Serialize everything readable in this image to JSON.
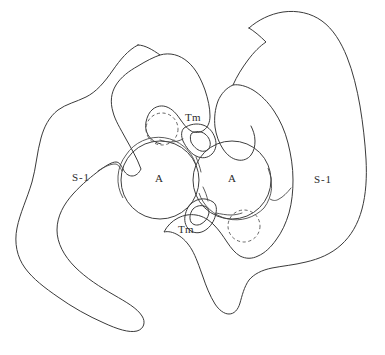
{
  "figure": {
    "background_color": "#ffffff",
    "line_color": "#3a3a3a",
    "width": 385,
    "height": 355
  },
  "labels": {
    "s1_left": "S-1",
    "s1_right": "S-1",
    "actin_left": "A",
    "actin_right": "A",
    "tm_top": "Tm",
    "tm_bottom": "Tm"
  },
  "structures": {
    "actin_left": {
      "name": "actin-filament-left",
      "cx": 160,
      "cy": 180,
      "r": 39
    },
    "actin_right": {
      "name": "actin-filament-right",
      "cx": 232,
      "cy": 180,
      "r": 39
    },
    "dashed_top": {
      "name": "tropomyosin-alternate-position-top",
      "cx": 162,
      "cy": 129,
      "r": 16
    },
    "dashed_bottom": {
      "name": "tropomyosin-alternate-position-bottom",
      "cx": 244,
      "cy": 226,
      "r": 16
    },
    "tm_top": {
      "name": "tropomyosin-top",
      "cx": 204,
      "cy": 140
    },
    "tm_bottom": {
      "name": "tropomyosin-bottom",
      "cx": 204,
      "cy": 213
    },
    "s1_left_lobe": {
      "name": "myosin-s1-left"
    },
    "s1_right_lobe": {
      "name": "myosin-s1-right"
    }
  }
}
